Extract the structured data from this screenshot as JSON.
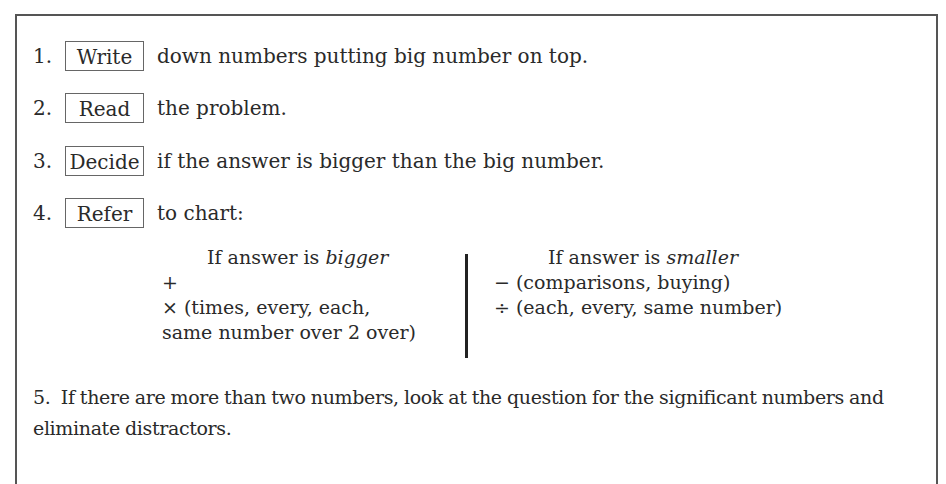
{
  "steps": [
    {
      "number": "1.",
      "keyword": "Write",
      "text": "down numbers putting big number on top."
    },
    {
      "number": "2.",
      "keyword": "Read",
      "text": "the problem."
    },
    {
      "number": "3.",
      "keyword": "Decide",
      "text": "if the answer is bigger than the big number."
    },
    {
      "number": "4.",
      "keyword": "Refer",
      "text": "to chart:"
    }
  ],
  "chart": {
    "bigger": {
      "heading_prefix": "If answer is ",
      "heading_emphasis": "bigger",
      "lines": [
        "+",
        "× (times, every, each,",
        "same number over 2 over)"
      ]
    },
    "smaller": {
      "heading_prefix": "If answer is ",
      "heading_emphasis": "smaller",
      "lines": [
        "− (comparisons, buying)",
        "÷ (each, every, same number)"
      ]
    }
  },
  "step5": {
    "number": "5.",
    "text": "If there are more than two numbers, look at the question for the significant numbers and eliminate distractors."
  }
}
